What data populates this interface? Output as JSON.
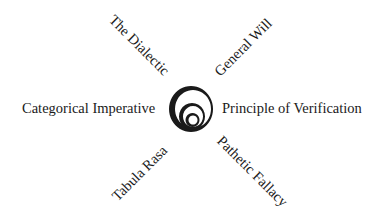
{
  "diagram": {
    "center": {
      "icon": "concentric-circles-icon"
    },
    "labels": {
      "top_left": "The Dialectic",
      "top_right": "General Will",
      "left": "Categorical Imperative",
      "right": "Principle of Verification",
      "bottom_left": "Tabula Rasa",
      "bottom_right": "Pathetic Fallacy"
    },
    "colors": {
      "ink": "#1a1a1a",
      "background": "#ffffff"
    }
  }
}
